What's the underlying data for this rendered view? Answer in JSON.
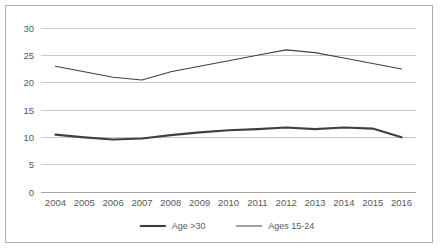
{
  "chart_data": {
    "type": "line",
    "title": "",
    "subtitle": "",
    "xlabel": "",
    "ylabel": "",
    "categories": [
      "2004",
      "2005",
      "2006",
      "2007",
      "2008",
      "2009",
      "2010",
      "2011",
      "2012",
      "2013",
      "2014",
      "2015",
      "2016"
    ],
    "x": [
      2004,
      2005,
      2006,
      2007,
      2008,
      2009,
      2010,
      2011,
      2012,
      2013,
      2014,
      2015,
      2016
    ],
    "series": [
      {
        "name": "Age >30",
        "values": [
          10.5,
          10.0,
          9.6,
          9.8,
          10.4,
          10.9,
          11.3,
          11.5,
          11.8,
          11.5,
          11.8,
          11.6,
          10.0
        ],
        "color": "#3f3f3f",
        "width": 2.1
      },
      {
        "name": "Ages 15-24",
        "values": [
          23.0,
          22.0,
          21.0,
          20.5,
          22.0,
          23.0,
          24.0,
          25.0,
          26.0,
          25.5,
          24.5,
          23.5,
          22.5
        ],
        "color": "#565656",
        "width": 1.1
      }
    ],
    "ylim": [
      0,
      30
    ],
    "yticks": [
      0,
      5,
      10,
      15,
      20,
      25,
      30
    ],
    "ytick_labels": [
      "0",
      "5",
      "10",
      "15",
      "20",
      "25",
      "30"
    ],
    "grid": true,
    "grid_axis": "y",
    "legend": {
      "position": "bottom",
      "entries": [
        {
          "label": "Age >30",
          "color": "#3f3f3f",
          "width": 2.1
        },
        {
          "label": "Ages 15-24",
          "color": "#565656",
          "width": 1.1
        }
      ]
    }
  },
  "frame": {
    "border_color": "#b0b0b0",
    "background": "#ffffff"
  }
}
